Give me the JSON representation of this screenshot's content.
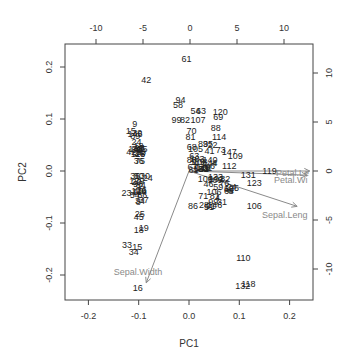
{
  "chart_data": {
    "type": "scatter",
    "subtype": "pca-biplot",
    "title": "",
    "xlabel": "PC1",
    "ylabel": "PC2",
    "xlim": [
      -0.24,
      0.25
    ],
    "ylim": [
      -0.245,
      0.245
    ],
    "x_ticks": [
      -0.2,
      -0.1,
      0.0,
      0.1,
      0.2
    ],
    "x_tick_labels": [
      "-0.2",
      "-0.1",
      "0.0",
      "0.1",
      "0.2"
    ],
    "y_ticks": [
      -0.2,
      -0.1,
      0.0,
      0.1,
      0.2
    ],
    "y_tick_labels": [
      "-0.2",
      "-0.1",
      "0.0",
      "0.1",
      "0.2"
    ],
    "top_ticks": [
      -10,
      -5,
      0,
      5,
      10
    ],
    "top_tick_labels": [
      "-10",
      "-5",
      "0",
      "5",
      "10"
    ],
    "right_ticks": [
      -10,
      -5,
      0,
      5,
      10
    ],
    "right_tick_labels": [
      "-10",
      "-5",
      "0",
      "5",
      "10"
    ],
    "grid": false,
    "legend": null,
    "point_color": "#222222",
    "arrow_color": "#8a8a8a",
    "points": [
      {
        "label": "61",
        "x": -0.005,
        "y": 0.215
      },
      {
        "label": "42",
        "x": -0.085,
        "y": 0.175
      },
      {
        "label": "94",
        "x": -0.017,
        "y": 0.137
      },
      {
        "label": "58",
        "x": -0.022,
        "y": 0.127
      },
      {
        "label": "54",
        "x": 0.013,
        "y": 0.116
      },
      {
        "label": "63",
        "x": 0.024,
        "y": 0.116
      },
      {
        "label": "120",
        "x": 0.062,
        "y": 0.113
      },
      {
        "label": "69",
        "x": 0.058,
        "y": 0.103
      },
      {
        "label": "99",
        "x": -0.025,
        "y": 0.098
      },
      {
        "label": "82",
        "x": -0.008,
        "y": 0.098
      },
      {
        "label": "107",
        "x": 0.018,
        "y": 0.098
      },
      {
        "label": "88",
        "x": 0.053,
        "y": 0.083
      },
      {
        "label": "70",
        "x": 0.005,
        "y": 0.077
      },
      {
        "label": "114",
        "x": 0.06,
        "y": 0.066
      },
      {
        "label": "81",
        "x": 0.003,
        "y": 0.066
      },
      {
        "label": "73",
        "x": 0.063,
        "y": 0.04
      },
      {
        "label": "147",
        "x": 0.08,
        "y": 0.036
      },
      {
        "label": "109",
        "x": 0.092,
        "y": 0.029
      },
      {
        "label": "108",
        "x": 0.022,
        "y": 0.017
      },
      {
        "label": "112",
        "x": 0.08,
        "y": 0.01
      },
      {
        "label": "67",
        "x": 0.007,
        "y": 0.008
      },
      {
        "label": "123",
        "x": 0.13,
        "y": -0.023
      },
      {
        "label": "131",
        "x": 0.118,
        "y": -0.007
      },
      {
        "label": "119",
        "x": 0.16,
        "y": 0.0
      },
      {
        "label": "106",
        "x": 0.13,
        "y": -0.068
      },
      {
        "label": "86",
        "x": 0.008,
        "y": -0.068
      },
      {
        "label": "51",
        "x": 0.04,
        "y": -0.07
      },
      {
        "label": "110",
        "x": 0.108,
        "y": -0.168
      },
      {
        "label": "118",
        "x": 0.118,
        "y": -0.218
      },
      {
        "label": "132",
        "x": 0.107,
        "y": -0.222
      },
      {
        "label": "9",
        "x": -0.108,
        "y": 0.091
      },
      {
        "label": "15",
        "x": -0.116,
        "y": 0.077
      },
      {
        "label": "39",
        "x": -0.103,
        "y": 0.074
      },
      {
        "label": "16",
        "x": -0.102,
        "y": -0.225
      },
      {
        "label": "34",
        "x": -0.11,
        "y": -0.155
      },
      {
        "label": "33",
        "x": -0.123,
        "y": -0.143
      },
      {
        "label": "15b",
        "x": -0.103,
        "y": -0.147
      },
      {
        "label": "18",
        "x": -0.1,
        "y": -0.113
      },
      {
        "label": "19",
        "x": -0.09,
        "y": -0.11
      },
      {
        "label": "25",
        "x": -0.098,
        "y": -0.082
      },
      {
        "label": "45",
        "x": -0.1,
        "y": -0.088
      },
      {
        "label": "23",
        "x": -0.124,
        "y": -0.043
      },
      {
        "label": "37",
        "x": -0.09,
        "y": -0.055
      },
      {
        "label": "36",
        "x": -0.1,
        "y": 0.02
      },
      {
        "label": "50",
        "x": -0.1,
        "y": -0.01
      },
      {
        "label": "24",
        "x": -0.082,
        "y": -0.013
      },
      {
        "label": "42b",
        "x": -0.115,
        "y": 0.037
      },
      {
        "label": "41",
        "x": -0.096,
        "y": 0.043
      }
    ],
    "loadings": [
      {
        "label": "Sepal.Width",
        "x": -0.085,
        "y": -0.215
      },
      {
        "label": "Sepal.Length",
        "x": 0.215,
        "y": -0.068
      },
      {
        "label": "Petal.Length",
        "x": 0.24,
        "y": 0.0
      },
      {
        "label": "Petal.Width",
        "x": 0.235,
        "y": -0.008
      }
    ]
  },
  "axes": {
    "xlabel": "PC1",
    "ylabel": "PC2"
  }
}
